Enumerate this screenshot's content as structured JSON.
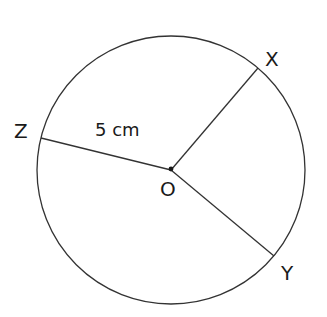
{
  "diagram": {
    "type": "circle-radii",
    "center": {
      "label": "O"
    },
    "points": [
      {
        "id": "X",
        "label": "X"
      },
      {
        "id": "Y",
        "label": "Y"
      },
      {
        "id": "Z",
        "label": "Z"
      }
    ],
    "radius_label": "5 cm",
    "segments": [
      "OX",
      "OY",
      "OZ"
    ],
    "colors": {
      "stroke": "#333333",
      "text": "#1a1a1a",
      "background": "#ffffff"
    }
  }
}
